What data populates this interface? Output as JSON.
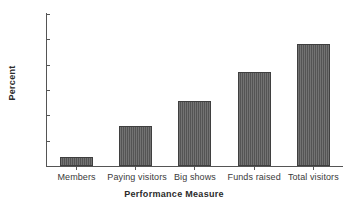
{
  "chart_data": {
    "type": "bar",
    "title": "",
    "subtitle": "",
    "categories": [
      "Members",
      "Paying visitors",
      "Big shows",
      "Funds raised",
      "Total visitors"
    ],
    "values": [
      13.1,
      16.7,
      19.7,
      23.1,
      26.5
    ],
    "xlabel": "Performance Measure",
    "ylabel": "Percent",
    "ylim": [
      12,
      30
    ],
    "yticks": [
      12,
      15,
      18,
      21,
      24,
      27,
      30
    ],
    "ytick_labels": [
      "12",
      "15",
      "18",
      "21",
      "24",
      "27",
      "30"
    ],
    "grid": false,
    "legend": false,
    "legend_position": "none",
    "bar_color": "#545454",
    "bar_edge_color": "#3f3f3f",
    "axis_color": "#555555",
    "background_color": "#ffffff"
  }
}
